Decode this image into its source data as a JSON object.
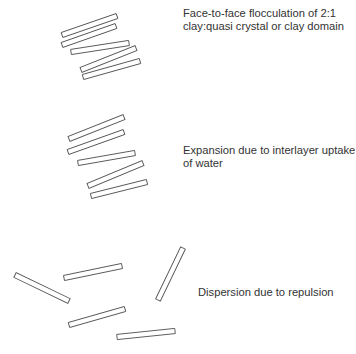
{
  "diagram": {
    "stroke_color": "#555555",
    "text_color": "#333333",
    "groups": [
      {
        "name": "flocculation",
        "label_lines": [
          "Face-to-face flocculation of 2:1",
          "clay:quasi crystal or clay domain"
        ],
        "platelets": [
          {
            "x1": 62,
            "y1": 35,
            "x2": 117,
            "y2": 16
          },
          {
            "x1": 62,
            "y1": 45,
            "x2": 116,
            "y2": 26
          },
          {
            "x1": 71,
            "y1": 52,
            "x2": 129,
            "y2": 43
          },
          {
            "x1": 81,
            "y1": 70,
            "x2": 136,
            "y2": 48
          },
          {
            "x1": 83,
            "y1": 77,
            "x2": 140,
            "y2": 61
          }
        ]
      },
      {
        "name": "expansion",
        "label_lines": [
          "Expansion due to interlayer uptake",
          "of water"
        ],
        "platelets": [
          {
            "x1": 69,
            "y1": 139,
            "x2": 124,
            "y2": 117
          },
          {
            "x1": 68,
            "y1": 152,
            "x2": 124,
            "y2": 132
          },
          {
            "x1": 78,
            "y1": 163,
            "x2": 135,
            "y2": 153
          },
          {
            "x1": 88,
            "y1": 186,
            "x2": 143,
            "y2": 163
          },
          {
            "x1": 91,
            "y1": 196,
            "x2": 147,
            "y2": 182
          }
        ]
      },
      {
        "name": "dispersion",
        "label_lines": [
          "Dispersion due to repulsion"
        ],
        "platelets": [
          {
            "x1": 15,
            "y1": 275,
            "x2": 69,
            "y2": 301
          },
          {
            "x1": 64,
            "y1": 278,
            "x2": 122,
            "y2": 266
          },
          {
            "x1": 158,
            "y1": 300,
            "x2": 183,
            "y2": 248
          },
          {
            "x1": 69,
            "y1": 325,
            "x2": 125,
            "y2": 309
          },
          {
            "x1": 117,
            "y1": 337,
            "x2": 175,
            "y2": 331
          }
        ]
      }
    ]
  }
}
